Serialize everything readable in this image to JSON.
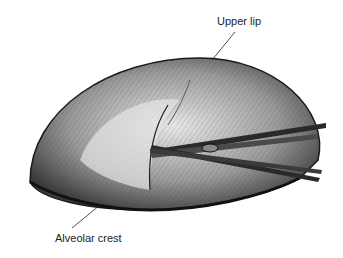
{
  "figure": {
    "labels": {
      "upper_lip": "Upper lip",
      "alveolar_crest": "Alveolar crest"
    },
    "colors": {
      "ink": "#1a1a1a",
      "shade": "#6b6b6b",
      "light": "#cfcfcf",
      "background": "#ffffff"
    }
  }
}
